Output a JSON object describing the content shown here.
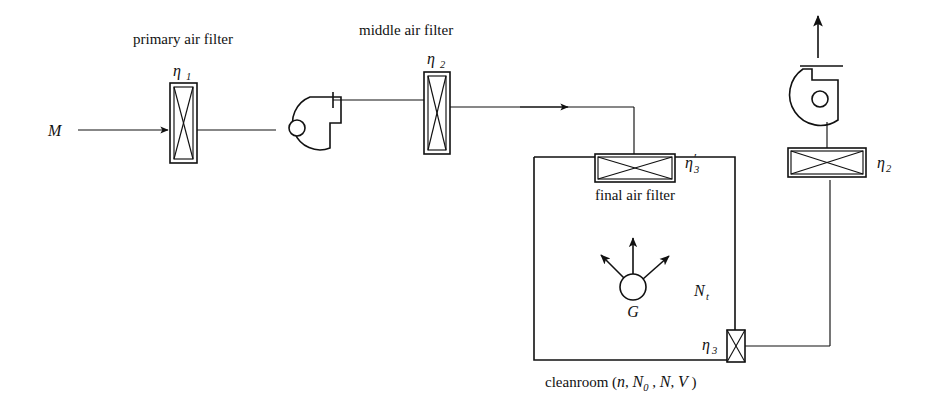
{
  "diagram": {
    "background_color": "#ffffff",
    "line_color": "#111111",
    "labels": {
      "inlet_flow": "M",
      "primary_filter_caption": "primary air filter",
      "primary_filter_eta": "η",
      "primary_filter_eta_sub": "1",
      "middle_filter_caption": "middle air filter",
      "middle_filter_eta": "η",
      "middle_filter_eta_sub": "2",
      "final_filter_caption": "final air filter",
      "final_filter_eta": "η",
      "final_filter_eta_sub": "3",
      "final_filter_eta_prime": "′",
      "return_filter_eta": "η",
      "return_filter_eta_sub": "3",
      "exhaust_filter_eta": "η",
      "exhaust_filter_eta_sub": "2",
      "room_concentration": "N",
      "room_concentration_sub": "t",
      "source_label": "G",
      "cleanroom_caption_prefix": "cleanroom (",
      "cleanroom_caption_n": "n",
      "cleanroom_caption_comma1": ", ",
      "cleanroom_caption_N0": "N",
      "cleanroom_caption_N0_sub": "0",
      "cleanroom_caption_comma2": " , ",
      "cleanroom_caption_N": "N",
      "cleanroom_caption_comma3": ", ",
      "cleanroom_caption_V": "V",
      "cleanroom_caption_suffix": " )"
    },
    "components": [
      {
        "name": "inlet-arrow",
        "type": "flow-arrow",
        "label": "M"
      },
      {
        "name": "primary-air-filter",
        "type": "filter-vertical",
        "efficiency": "η1"
      },
      {
        "name": "supply-fan",
        "type": "centrifugal-fan"
      },
      {
        "name": "middle-air-filter",
        "type": "filter-vertical",
        "efficiency": "η2"
      },
      {
        "name": "supply-duct-arrow",
        "type": "flow-arrow"
      },
      {
        "name": "final-air-filter",
        "type": "filter-horizontal",
        "efficiency": "η3′"
      },
      {
        "name": "cleanroom",
        "type": "room",
        "parameters": "n, N0, N, V"
      },
      {
        "name": "contamination-source",
        "type": "source",
        "label": "G"
      },
      {
        "name": "return-air-filter",
        "type": "filter-vertical-small",
        "efficiency": "η3"
      },
      {
        "name": "exhaust-air-filter",
        "type": "filter-horizontal",
        "efficiency": "η2"
      },
      {
        "name": "exhaust-fan",
        "type": "centrifugal-fan"
      },
      {
        "name": "exhaust-arrow",
        "type": "flow-arrow"
      }
    ]
  }
}
